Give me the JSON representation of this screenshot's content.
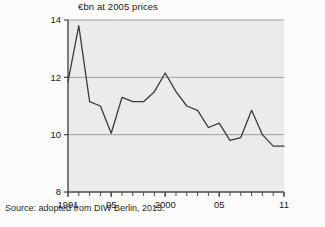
{
  "figure": {
    "title": "€bn at 2005 prices",
    "source_note": "Source: adopted from DIW Berlin, 2013.",
    "plot_background": "#ebebeb",
    "line_color": "#3a3a3a",
    "grid_color": "#8c8c8c",
    "axis_color": "#4a4a4a"
  },
  "chart_data": {
    "type": "line",
    "title": "€bn at 2005 prices",
    "subtitle": "",
    "xlabel": "",
    "ylabel": "€bn at 2005 prices",
    "xlim": [
      1991,
      2011
    ],
    "ylim": [
      8,
      14
    ],
    "grid": true,
    "gridlines_y": [
      10,
      12,
      14
    ],
    "legend": false,
    "legend_position": "none",
    "x_tick_labels": [
      "1991",
      "95",
      "2000",
      "05",
      "11"
    ],
    "x_tick_values": [
      1991,
      1995,
      2000,
      2005,
      2011
    ],
    "x_minor_ticks_every": 1,
    "y_tick_labels": [
      "8",
      "10",
      "12",
      "14"
    ],
    "y_tick_values": [
      8,
      10,
      12,
      14
    ],
    "x": [
      1991,
      1992,
      1993,
      1994,
      1995,
      1996,
      1997,
      1998,
      1999,
      2000,
      2001,
      2002,
      2003,
      2004,
      2005,
      2006,
      2007,
      2008,
      2009,
      2010,
      2011
    ],
    "values": [
      11.85,
      13.8,
      11.15,
      11.0,
      10.05,
      11.3,
      11.15,
      11.15,
      11.5,
      12.15,
      11.5,
      11.0,
      10.85,
      10.25,
      10.4,
      9.8,
      9.9,
      10.85,
      10.0,
      9.6,
      9.6
    ],
    "series": [
      {
        "name": "Construction investment",
        "values": [
          11.85,
          13.8,
          11.15,
          11.0,
          10.05,
          11.3,
          11.15,
          11.15,
          11.5,
          12.15,
          11.5,
          11.0,
          10.85,
          10.25,
          10.4,
          9.8,
          9.9,
          10.85,
          10.0,
          9.6,
          9.6
        ]
      }
    ],
    "annotations": []
  }
}
